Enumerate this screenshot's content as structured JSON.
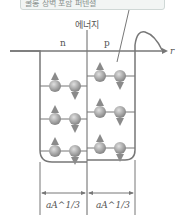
{
  "callout": {
    "text": "쿨롱 장벽 포함 퍼텐셜"
  },
  "axis": {
    "energy_label": "에너지",
    "r_label": "r"
  },
  "wells": {
    "neutron_label": "n",
    "proton_label": "p"
  },
  "widths": {
    "left_label": "aA^1/3",
    "right_label": "aA^1/3"
  },
  "neutron_levels_y": [
    86,
    119,
    151
  ],
  "proton_levels_y": [
    76,
    112,
    148
  ],
  "colors": {
    "line": "#777777",
    "particle": "#9a9a9a"
  }
}
